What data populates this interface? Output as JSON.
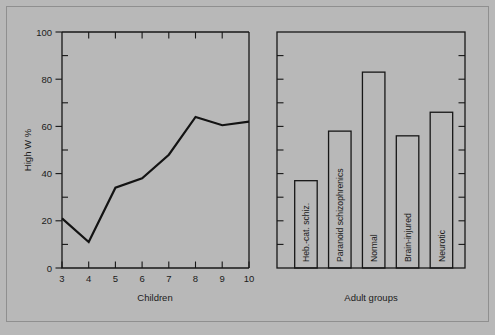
{
  "figure": {
    "background_color": "#b8b8b8",
    "ink_color": "#171717"
  },
  "chart_data": [
    {
      "type": "line",
      "panel": "left",
      "title": "",
      "xlabel": "Children",
      "ylabel": "High W %",
      "xlim": [
        3,
        10
      ],
      "ylim": [
        0,
        100
      ],
      "xticks": [
        3,
        4,
        5,
        6,
        7,
        8,
        9,
        10
      ],
      "xtick_labels": [
        "3",
        "4",
        "5",
        "6",
        "7",
        "8",
        "9",
        "10"
      ],
      "yticks": [
        0,
        20,
        40,
        60,
        80,
        100
      ],
      "ytick_labels": [
        "0",
        "20",
        "40",
        "60",
        "80",
        "100"
      ],
      "yminor_ticks": [
        10,
        30,
        50,
        70,
        90
      ],
      "grid": false,
      "legend": false,
      "x": [
        3,
        4,
        5,
        6,
        7,
        8,
        9,
        10
      ],
      "values": [
        21,
        11,
        34,
        38,
        48,
        64,
        60.5,
        62
      ],
      "series": [
        {
          "name": "High W %",
          "values": [
            21,
            11,
            34,
            38,
            48,
            64,
            60.5,
            62
          ]
        }
      ]
    },
    {
      "type": "bar",
      "panel": "right",
      "title": "",
      "xlabel": "Adult groups",
      "ylabel": "",
      "ylim": [
        0,
        100
      ],
      "yticks": [
        10,
        20,
        30,
        40,
        50,
        60,
        70,
        80,
        90
      ],
      "ytick_labels": [
        "",
        "",
        "",
        "",
        "",
        "",
        "",
        "",
        ""
      ],
      "grid": false,
      "legend": false,
      "axis_side": "right",
      "categories": [
        "Heb.-cat. schiz.",
        "Paranoid schizophrenics",
        "Normal",
        "Brain-injured",
        "Neurotic"
      ],
      "values": [
        37,
        58,
        83,
        56,
        66
      ],
      "series": [
        {
          "name": "High W %",
          "values": [
            37,
            58,
            83,
            56,
            66
          ]
        }
      ]
    }
  ],
  "left_panel": {
    "y_axis_title": "High W %",
    "x_axis_title": "Children",
    "ytick_labels": [
      "100",
      "80",
      "60",
      "40",
      "20",
      "0"
    ],
    "xtick_labels": [
      "3",
      "4",
      "5",
      "6",
      "7",
      "8",
      "9",
      "10"
    ]
  },
  "right_panel": {
    "x_axis_title": "Adult groups",
    "bar_labels": [
      "Heb.-cat. schiz.",
      "Paranoid schizophrenics",
      "Normal",
      "Brain-injured",
      "Neurotic"
    ]
  }
}
